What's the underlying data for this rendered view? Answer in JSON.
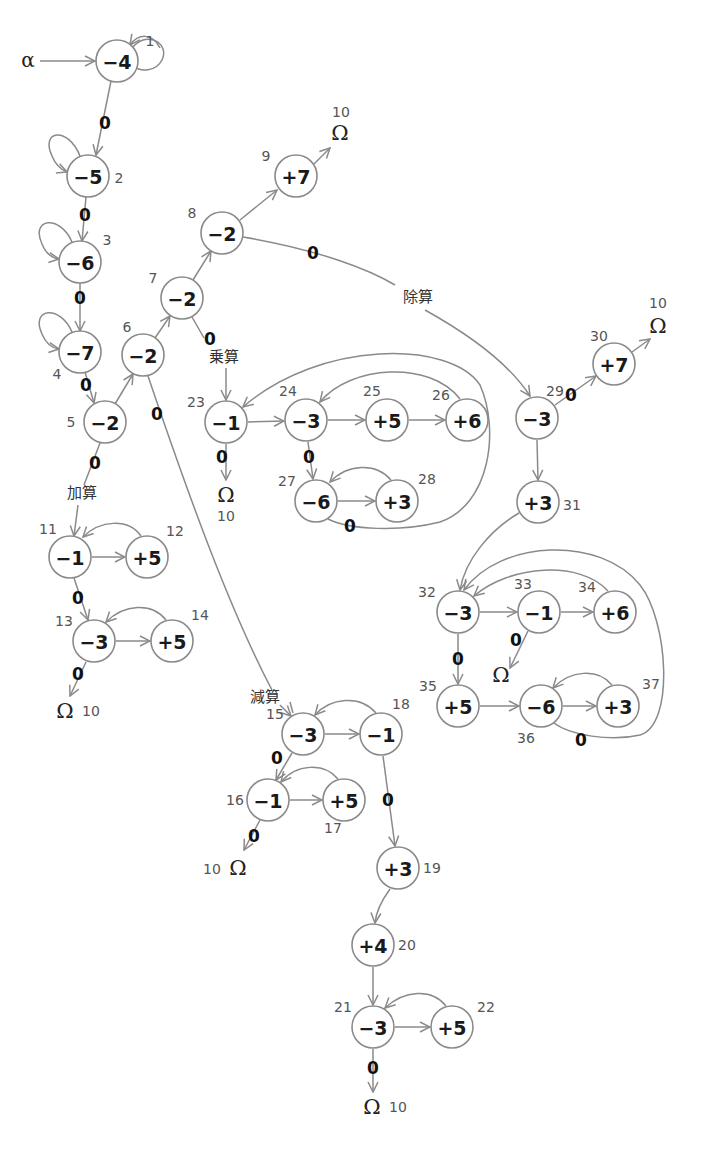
{
  "diagram": {
    "start_symbol": "α",
    "terminal_symbol": "Ω",
    "terminal_id": "10",
    "colors": {
      "edge": "#8a8a8a",
      "node_border": "#8a8a8a",
      "text": "#1a1a1a",
      "id_text": "#555555"
    },
    "operation_labels": {
      "add": "加算",
      "subtract": "減算",
      "multiply": "乗算",
      "divide": "除算"
    },
    "zero_label": "0",
    "nodes": [
      {
        "id": "1",
        "value": "−4",
        "x": 117,
        "y": 61
      },
      {
        "id": "2",
        "value": "−5",
        "x": 88,
        "y": 176
      },
      {
        "id": "3",
        "value": "−6",
        "x": 80,
        "y": 262
      },
      {
        "id": "4",
        "value": "−7",
        "x": 80,
        "y": 352
      },
      {
        "id": "5",
        "value": "−2",
        "x": 105,
        "y": 422
      },
      {
        "id": "6",
        "value": "−2",
        "x": 143,
        "y": 355
      },
      {
        "id": "7",
        "value": "−2",
        "x": 182,
        "y": 298
      },
      {
        "id": "8",
        "value": "−2",
        "x": 222,
        "y": 233
      },
      {
        "id": "9",
        "value": "+7",
        "x": 296,
        "y": 176
      },
      {
        "id": "11",
        "value": "−1",
        "x": 70,
        "y": 557
      },
      {
        "id": "12",
        "value": "+5",
        "x": 147,
        "y": 557
      },
      {
        "id": "13",
        "value": "−3",
        "x": 94,
        "y": 641
      },
      {
        "id": "14",
        "value": "+5",
        "x": 172,
        "y": 641
      },
      {
        "id": "15",
        "value": "−3",
        "x": 303,
        "y": 734
      },
      {
        "id": "16",
        "value": "−1",
        "x": 268,
        "y": 800
      },
      {
        "id": "17",
        "value": "+5",
        "x": 344,
        "y": 800
      },
      {
        "id": "18",
        "value": "−1",
        "x": 381,
        "y": 734
      },
      {
        "id": "19",
        "value": "+3",
        "x": 398,
        "y": 868
      },
      {
        "id": "20",
        "value": "+4",
        "x": 373,
        "y": 945
      },
      {
        "id": "21",
        "value": "−3",
        "x": 373,
        "y": 1027
      },
      {
        "id": "22",
        "value": "+5",
        "x": 452,
        "y": 1027
      },
      {
        "id": "23",
        "value": "−1",
        "x": 226,
        "y": 422
      },
      {
        "id": "24",
        "value": "−3",
        "x": 306,
        "y": 420
      },
      {
        "id": "25",
        "value": "+5",
        "x": 387,
        "y": 420
      },
      {
        "id": "26",
        "value": "+6",
        "x": 467,
        "y": 420
      },
      {
        "id": "27",
        "value": "−6",
        "x": 316,
        "y": 501
      },
      {
        "id": "28",
        "value": "+3",
        "x": 397,
        "y": 501
      },
      {
        "id": "29",
        "value": "−3",
        "x": 537,
        "y": 418
      },
      {
        "id": "30",
        "value": "+7",
        "x": 614,
        "y": 364
      },
      {
        "id": "31",
        "value": "+3",
        "x": 538,
        "y": 502
      },
      {
        "id": "32",
        "value": "−3",
        "x": 458,
        "y": 612
      },
      {
        "id": "33",
        "value": "−1",
        "x": 539,
        "y": 612
      },
      {
        "id": "34",
        "value": "+6",
        "x": 615,
        "y": 612
      },
      {
        "id": "35",
        "value": "+5",
        "x": 458,
        "y": 706
      },
      {
        "id": "36",
        "value": "−6",
        "x": 541,
        "y": 706
      },
      {
        "id": "37",
        "value": "+3",
        "x": 618,
        "y": 706
      }
    ],
    "edges": [
      {
        "from": "α",
        "to": "1",
        "label": ""
      },
      {
        "from": "1",
        "to": "1",
        "label": "",
        "type": "self-loop"
      },
      {
        "from": "1",
        "to": "2",
        "label": "0"
      },
      {
        "from": "2",
        "to": "2",
        "label": "",
        "type": "self-loop"
      },
      {
        "from": "2",
        "to": "3",
        "label": "0"
      },
      {
        "from": "3",
        "to": "3",
        "label": "",
        "type": "self-loop"
      },
      {
        "from": "3",
        "to": "4",
        "label": "0"
      },
      {
        "from": "4",
        "to": "4",
        "label": "",
        "type": "self-loop"
      },
      {
        "from": "4",
        "to": "5",
        "label": "0"
      },
      {
        "from": "5",
        "to": "6",
        "label": ""
      },
      {
        "from": "6",
        "to": "7",
        "label": ""
      },
      {
        "from": "7",
        "to": "8",
        "label": ""
      },
      {
        "from": "8",
        "to": "9",
        "label": ""
      },
      {
        "from": "9",
        "to": "Ω",
        "label": ""
      },
      {
        "from": "5",
        "to": "11",
        "label": "0",
        "op": "加算"
      },
      {
        "from": "6",
        "to": "15",
        "label": "0",
        "op": "減算"
      },
      {
        "from": "7",
        "to": "23",
        "label": "0",
        "op": "乗算"
      },
      {
        "from": "8",
        "to": "29",
        "label": "0",
        "op": "除算"
      },
      {
        "from": "11",
        "to": "12",
        "label": ""
      },
      {
        "from": "12",
        "to": "11",
        "label": ""
      },
      {
        "from": "11",
        "to": "13",
        "label": "0"
      },
      {
        "from": "13",
        "to": "14",
        "label": ""
      },
      {
        "from": "14",
        "to": "13",
        "label": ""
      },
      {
        "from": "13",
        "to": "Ω",
        "label": "0"
      },
      {
        "from": "15",
        "to": "18",
        "label": ""
      },
      {
        "from": "18",
        "to": "15",
        "label": ""
      },
      {
        "from": "15",
        "to": "16",
        "label": "0"
      },
      {
        "from": "16",
        "to": "17",
        "label": ""
      },
      {
        "from": "17",
        "to": "16",
        "label": ""
      },
      {
        "from": "16",
        "to": "Ω",
        "label": "0"
      },
      {
        "from": "18",
        "to": "19",
        "label": "0"
      },
      {
        "from": "19",
        "to": "20",
        "label": ""
      },
      {
        "from": "20",
        "to": "21",
        "label": ""
      },
      {
        "from": "21",
        "to": "22",
        "label": ""
      },
      {
        "from": "22",
        "to": "21",
        "label": ""
      },
      {
        "from": "21",
        "to": "Ω",
        "label": "0"
      },
      {
        "from": "23",
        "to": "24",
        "label": ""
      },
      {
        "from": "24",
        "to": "25",
        "label": ""
      },
      {
        "from": "25",
        "to": "26",
        "label": ""
      },
      {
        "from": "26",
        "to": "24",
        "label": ""
      },
      {
        "from": "24",
        "to": "27",
        "label": "0"
      },
      {
        "from": "27",
        "to": "28",
        "label": ""
      },
      {
        "from": "28",
        "to": "27",
        "label": ""
      },
      {
        "from": "27",
        "to": "23",
        "label": "0"
      },
      {
        "from": "23",
        "to": "Ω",
        "label": "0"
      },
      {
        "from": "29",
        "to": "30",
        "label": "0"
      },
      {
        "from": "30",
        "to": "Ω",
        "label": ""
      },
      {
        "from": "29",
        "to": "31",
        "label": ""
      },
      {
        "from": "31",
        "to": "32",
        "label": ""
      },
      {
        "from": "32",
        "to": "33",
        "label": ""
      },
      {
        "from": "33",
        "to": "34",
        "label": ""
      },
      {
        "from": "34",
        "to": "32",
        "label": ""
      },
      {
        "from": "33",
        "to": "Ω",
        "label": "0"
      },
      {
        "from": "32",
        "to": "35",
        "label": "0"
      },
      {
        "from": "35",
        "to": "36",
        "label": ""
      },
      {
        "from": "36",
        "to": "37",
        "label": ""
      },
      {
        "from": "37",
        "to": "36",
        "label": ""
      },
      {
        "from": "36",
        "to": "32",
        "label": "0"
      }
    ]
  }
}
